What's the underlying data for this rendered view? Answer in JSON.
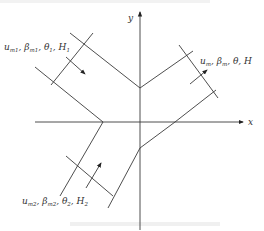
{
  "diagram": {
    "type": "confluence-channel-schematic",
    "axes": {
      "x_label": "x",
      "y_label": "y"
    },
    "branches": [
      {
        "id": "tributary-1",
        "position": "upper-left",
        "flow_direction": "toward-junction",
        "label": {
          "parts": [
            {
              "base": "u",
              "sub": "m1"
            },
            {
              "base": "β",
              "sub": "m1"
            },
            {
              "base": "θ",
              "sub": "1"
            },
            {
              "base": "H",
              "sub": "1"
            }
          ]
        }
      },
      {
        "id": "main-channel",
        "position": "upper-right",
        "flow_direction": "away-from-junction",
        "label": {
          "parts": [
            {
              "base": "u",
              "sub": "m"
            },
            {
              "base": "β",
              "sub": "m"
            },
            {
              "base": "θ",
              "sub": ""
            },
            {
              "base": "H",
              "sub": ""
            }
          ]
        }
      },
      {
        "id": "tributary-2",
        "position": "lower-left",
        "flow_direction": "toward-junction",
        "label": {
          "parts": [
            {
              "base": "u",
              "sub": "m2"
            },
            {
              "base": "β",
              "sub": "m2"
            },
            {
              "base": "θ",
              "sub": "2"
            },
            {
              "base": "H",
              "sub": "2"
            }
          ]
        }
      }
    ],
    "colors": {
      "line": "#3a3a3a",
      "text": "#333333",
      "background": "#ffffff"
    }
  }
}
